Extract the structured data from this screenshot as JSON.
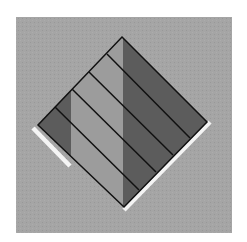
{
  "figure": {
    "canvas": {
      "width": 247,
      "height": 242
    },
    "colors": {
      "page_background": "#ffffff",
      "square_background": "#a5a5a5",
      "diamond_light": "#9c9c9c",
      "diamond_dark": "#5c5c5c",
      "stripe_line": "#111111",
      "highlight_strip": "#f4f4f4"
    },
    "square": {
      "x": 16,
      "y": 17,
      "width": 216,
      "height": 216
    },
    "diamond": {
      "top": [
        122,
        37
      ],
      "right": [
        207,
        122
      ],
      "bottom": [
        124,
        207
      ],
      "left": [
        38,
        125
      ]
    },
    "dark_bands": [
      {
        "name": "left-band",
        "x_from": 38,
        "x_to": 71
      },
      {
        "name": "right-band",
        "x_from": 123,
        "x_to": 207
      }
    ],
    "stripe_lines": [
      {
        "from": [
          107,
          54
        ],
        "to": [
          190,
          138
        ]
      },
      {
        "from": [
          89,
          72
        ],
        "to": [
          173,
          155
        ]
      },
      {
        "from": [
          72,
          89
        ],
        "to": [
          156,
          172
        ]
      },
      {
        "from": [
          55,
          107
        ],
        "to": [
          139,
          190
        ]
      }
    ],
    "highlight_strips": [
      {
        "name": "lower-left-strip",
        "from": [
          33,
          128
        ],
        "to": [
          70,
          166
        ]
      },
      {
        "name": "lower-right-strip",
        "from": [
          210,
          122
        ],
        "to": [
          124,
          210
        ]
      }
    ]
  }
}
